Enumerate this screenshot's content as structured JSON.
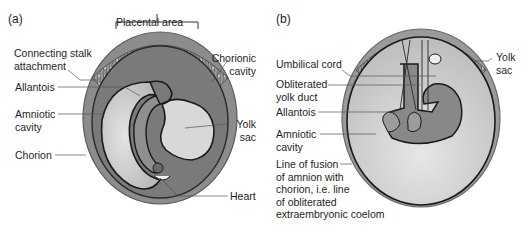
{
  "panels": [
    {
      "id": "a",
      "label": "(a)",
      "labels": {
        "placental_area": "Placental area",
        "connecting_stalk": "Connecting stalk\nattachment",
        "allantois": "Allantois",
        "amniotic_cavity": "Amniotic\ncavity",
        "chorion": "Chorion",
        "chorionic_cavity": "Chorionic\ncavity",
        "yolk_sac": "Yolk\nsac",
        "heart": "Heart"
      }
    },
    {
      "id": "b",
      "label": "(b)",
      "labels": {
        "umbilical_cord": "Umbilical cord",
        "obliterated_yolk_duct": "Obliterated\nyolk duct",
        "allantois": "Allantois",
        "amniotic_cavity": "Amniotic\ncavity",
        "line_of_fusion": "Line of fusion\nof amnion with\nchorion, i.e. line\nof obliterated\nextraembryonic coelom",
        "yolk_sac": "Yolk\nsac"
      }
    }
  ],
  "colors": {
    "placenta": "#8a8a8a",
    "chorionic_cavity": "#7c7c7c",
    "amniotic_cavity": "#c8c8c8",
    "yolk_sac": "#d6d6d6",
    "outline": "#1a1a1a",
    "leader": "#555555"
  }
}
